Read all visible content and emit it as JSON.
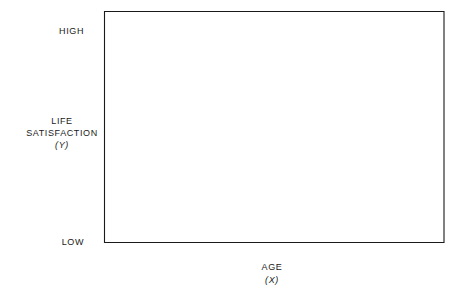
{
  "chart_data": {
    "type": "scatter",
    "title": "",
    "xlabel": "AGE",
    "xlabel_symbol": "(X)",
    "ylabel_line1": "LIFE",
    "ylabel_line2": "SATISFACTION",
    "ylabel_symbol": "(Y)",
    "xlim": [
      5,
      82
    ],
    "ylim": [
      0,
      10.5
    ],
    "xticks": [
      10,
      20,
      30,
      40,
      50,
      60,
      70,
      80
    ],
    "xtick_labels": [
      "10",
      "20",
      "30",
      "40",
      "50",
      "60",
      "70",
      "80"
    ],
    "yticks": [
      0,
      1,
      2,
      3,
      4,
      5,
      6,
      7,
      8,
      9,
      10
    ],
    "ytick_labels": [
      "0",
      "1",
      "2",
      "3",
      "4",
      "5",
      "6",
      "7",
      "8",
      "9",
      "10"
    ],
    "y_high_label": "HIGH",
    "y_low_label": "LOW",
    "grid": false,
    "legend": false,
    "marker_color": "#000000",
    "marker_size": 3.6,
    "axis_color": "#1a1a1a",
    "background_color": "#ffffff",
    "divider": {
      "x": 40,
      "style": "dashed",
      "color": "#1a1a1a"
    },
    "annotations": [
      {
        "name": "left-correlation",
        "text": "r = − 0.51",
        "r_symbol": "r",
        "r_value": "= − 0.51",
        "x": 23,
        "y": 10.25
      },
      {
        "name": "right-correlation",
        "text": "r = − 0.38",
        "r_symbol": "r",
        "r_value": "= − 0.38",
        "x": 58,
        "y": 10.25
      }
    ],
    "series": [
      {
        "name": "Under 40",
        "correlation": -0.51,
        "n": 14,
        "points": [
          [
            13.5,
            7.95
          ],
          [
            16.2,
            6.95
          ],
          [
            17.5,
            9.05
          ],
          [
            18.7,
            6.05
          ],
          [
            24.5,
            7.9
          ],
          [
            24.9,
            6.05
          ],
          [
            24.8,
            4.9
          ],
          [
            31.2,
            7.0
          ],
          [
            31.0,
            4.85
          ],
          [
            33.9,
            7.9
          ],
          [
            34.0,
            6.15
          ],
          [
            34.0,
            3.9
          ],
          [
            37.5,
            6.9
          ],
          [
            38.1,
            3.9
          ]
        ]
      },
      {
        "name": "40 and over",
        "correlation": -0.38,
        "n": 16,
        "points": [
          [
            45.1,
            3.8
          ],
          [
            47.4,
            6.15
          ],
          [
            48.8,
            3.0
          ],
          [
            51.1,
            6.95
          ],
          [
            51.2,
            4.95
          ],
          [
            57.0,
            4.8
          ],
          [
            59.0,
            3.55
          ],
          [
            59.2,
            1.95
          ],
          [
            61.0,
            5.95
          ],
          [
            64.7,
            4.7
          ],
          [
            65.0,
            3.8
          ],
          [
            69.2,
            1.85
          ],
          [
            69.3,
            0.6
          ],
          [
            71.0,
            4.75
          ],
          [
            72.8,
            3.65
          ],
          [
            50.0,
            7.0
          ]
        ]
      }
    ]
  }
}
